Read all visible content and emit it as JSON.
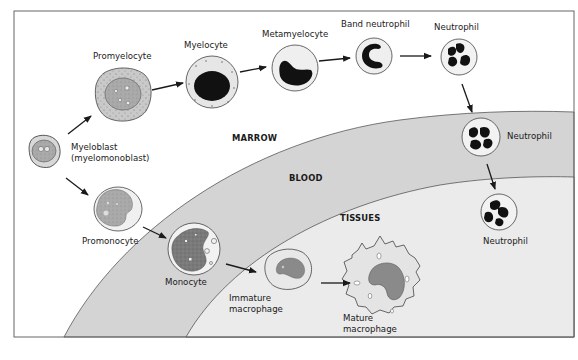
{
  "diagram": {
    "colors": {
      "frame": "#555555",
      "marrow": "#ffffff",
      "blood": "#d6d6d6",
      "tissues": "#ebebeb",
      "arrow": "#1a1a1a",
      "dark_nucleus": "#111111",
      "grey_nucleus": "#8a8a8a",
      "cytoplasm_granular": "#c8c8c8",
      "cytoplasm_light": "#f2f2f2"
    },
    "regions": [
      {
        "id": "marrow",
        "label": "MARROW"
      },
      {
        "id": "blood",
        "label": "BLOOD"
      },
      {
        "id": "tissues",
        "label": "TISSUES"
      }
    ],
    "cells": [
      {
        "id": "myeloblast",
        "label_lines": [
          "Myeloblast",
          "(myelomonoblast)"
        ],
        "region": "marrow"
      },
      {
        "id": "promyelocyte",
        "label_lines": [
          "Promyelocyte"
        ],
        "region": "marrow"
      },
      {
        "id": "myelocyte",
        "label_lines": [
          "Myelocyte"
        ],
        "region": "marrow"
      },
      {
        "id": "metamyelocyte",
        "label_lines": [
          "Metamyelocyte"
        ],
        "region": "marrow"
      },
      {
        "id": "band-neutrophil",
        "label_lines": [
          "Band neutrophil"
        ],
        "region": "marrow"
      },
      {
        "id": "neutrophil-marrow",
        "label_lines": [
          "Neutrophil"
        ],
        "region": "marrow"
      },
      {
        "id": "neutrophil-blood",
        "label_lines": [
          "Neutrophil"
        ],
        "region": "blood"
      },
      {
        "id": "neutrophil-tissue",
        "label_lines": [
          "Neutrophil"
        ],
        "region": "tissues"
      },
      {
        "id": "promonocyte",
        "label_lines": [
          "Promonocyte"
        ],
        "region": "marrow"
      },
      {
        "id": "monocyte",
        "label_lines": [
          "Monocyte"
        ],
        "region": "blood"
      },
      {
        "id": "immature-macrophage",
        "label_lines": [
          "Immature",
          "macrophage"
        ],
        "region": "tissues"
      },
      {
        "id": "mature-macrophage",
        "label_lines": [
          "Mature",
          "macrophage"
        ],
        "region": "tissues"
      }
    ],
    "arrows": [
      {
        "from": "myeloblast",
        "to": "promyelocyte"
      },
      {
        "from": "promyelocyte",
        "to": "myelocyte"
      },
      {
        "from": "myelocyte",
        "to": "metamyelocyte"
      },
      {
        "from": "metamyelocyte",
        "to": "band-neutrophil"
      },
      {
        "from": "band-neutrophil",
        "to": "neutrophil-marrow"
      },
      {
        "from": "neutrophil-marrow",
        "to": "neutrophil-blood"
      },
      {
        "from": "neutrophil-blood",
        "to": "neutrophil-tissue"
      },
      {
        "from": "myeloblast",
        "to": "promonocyte"
      },
      {
        "from": "promonocyte",
        "to": "monocyte"
      },
      {
        "from": "monocyte",
        "to": "immature-macrophage"
      },
      {
        "from": "immature-macrophage",
        "to": "mature-macrophage"
      }
    ]
  }
}
